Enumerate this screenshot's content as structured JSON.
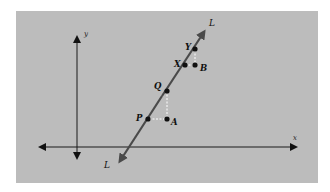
{
  "diagram": {
    "background_color": "#bcbcbc",
    "axes": {
      "x_label": "x",
      "y_label": "y",
      "color": "#1a1a1a"
    },
    "line": {
      "label_top": "L",
      "label_bottom": "L",
      "color": "#4a4a4a"
    },
    "points": {
      "P": "P",
      "A": "A",
      "Q": "Q",
      "X": "X",
      "B": "B",
      "Y": "Y"
    },
    "guide_color": "#ffffff"
  }
}
